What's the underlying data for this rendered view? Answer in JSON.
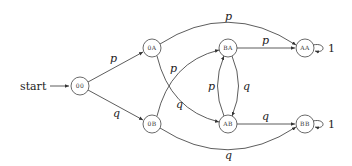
{
  "diagram": {
    "type": "state-machine",
    "start_label": "start",
    "nodes": [
      {
        "id": "00",
        "label": "00",
        "x": 80,
        "y": 86
      },
      {
        "id": "0A",
        "label": "0A",
        "x": 152,
        "y": 48
      },
      {
        "id": "0B",
        "label": "0B",
        "x": 152,
        "y": 124
      },
      {
        "id": "BA",
        "label": "BA",
        "x": 228,
        "y": 48
      },
      {
        "id": "AB",
        "label": "AB",
        "x": 228,
        "y": 124
      },
      {
        "id": "AA",
        "label": "AA",
        "x": 305,
        "y": 48
      },
      {
        "id": "BB",
        "label": "BB",
        "x": 305,
        "y": 124
      }
    ],
    "edges": [
      {
        "from": "00",
        "to": "0A",
        "label": "p"
      },
      {
        "from": "00",
        "to": "0B",
        "label": "q"
      },
      {
        "from": "0A",
        "to": "AA",
        "label": "p"
      },
      {
        "from": "0A",
        "to": "AB",
        "label": "q"
      },
      {
        "from": "0B",
        "to": "BA",
        "label": "p"
      },
      {
        "from": "0B",
        "to": "BB",
        "label": "q"
      },
      {
        "from": "BA",
        "to": "AA",
        "label": "p"
      },
      {
        "from": "BA",
        "to": "AB",
        "label": "q"
      },
      {
        "from": "AB",
        "to": "BA",
        "label": "p"
      },
      {
        "from": "AB",
        "to": "BB",
        "label": "q"
      },
      {
        "from": "AA",
        "to": "AA",
        "label": "1"
      },
      {
        "from": "BB",
        "to": "BB",
        "label": "1"
      }
    ]
  }
}
